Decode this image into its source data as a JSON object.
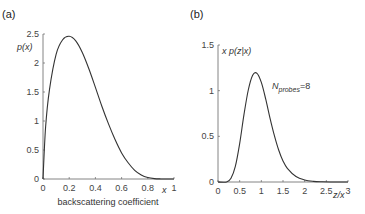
{
  "panels": {
    "a": {
      "label": "(a)"
    },
    "b": {
      "label": "(b)"
    }
  },
  "chart_data": [
    {
      "type": "line",
      "panel": "(a)",
      "title": "",
      "xlabel": "backscattering coefficient",
      "x_symbol": "x",
      "ylabel": "p(x)",
      "xlim": [
        0,
        1
      ],
      "ylim": [
        0,
        2.5
      ],
      "xticks": [
        "0",
        "0.2",
        "0.4",
        "0.6",
        "0.8",
        "1"
      ],
      "yticks": [
        "0",
        "0.5",
        "1",
        "1.5",
        "2",
        "2.5"
      ],
      "grid": false,
      "series": [
        {
          "name": "p(x)",
          "x": [
            0,
            0.02,
            0.05,
            0.1,
            0.15,
            0.2,
            0.25,
            0.3,
            0.35,
            0.4,
            0.45,
            0.5,
            0.55,
            0.6,
            0.65,
            0.7,
            0.75,
            0.8,
            0.85,
            0.9,
            0.95,
            1.0
          ],
          "y": [
            0,
            0.9,
            1.55,
            2.15,
            2.4,
            2.46,
            2.38,
            2.18,
            1.9,
            1.58,
            1.25,
            0.95,
            0.68,
            0.45,
            0.28,
            0.15,
            0.07,
            0.025,
            0.006,
            0.001,
            0,
            0
          ]
        }
      ]
    },
    {
      "type": "line",
      "panel": "(b)",
      "title": "",
      "xlabel": "z/x",
      "ylabel": "x p(z|x)",
      "annotation": {
        "text_main": "N",
        "text_sub": "probes",
        "text_tail": "=8"
      },
      "xlim": [
        0,
        3
      ],
      "ylim": [
        0,
        1.5
      ],
      "xticks": [
        "0",
        "0.5",
        "1",
        "1.5",
        "2",
        "2.5",
        "3"
      ],
      "yticks": [
        "0",
        "0.5",
        "1",
        "1.5"
      ],
      "grid": false,
      "series": [
        {
          "name": "N_probes=8",
          "x": [
            0,
            0.2,
            0.3,
            0.4,
            0.5,
            0.6,
            0.7,
            0.8,
            0.9,
            1.0,
            1.1,
            1.2,
            1.3,
            1.4,
            1.5,
            1.6,
            1.8,
            2.0,
            2.2,
            2.4,
            2.6,
            3.0
          ],
          "y": [
            0,
            0.0,
            0.04,
            0.17,
            0.42,
            0.74,
            1.01,
            1.17,
            1.19,
            1.09,
            0.91,
            0.7,
            0.51,
            0.35,
            0.23,
            0.15,
            0.06,
            0.022,
            0.007,
            0.002,
            0.0005,
            0
          ]
        }
      ]
    }
  ]
}
